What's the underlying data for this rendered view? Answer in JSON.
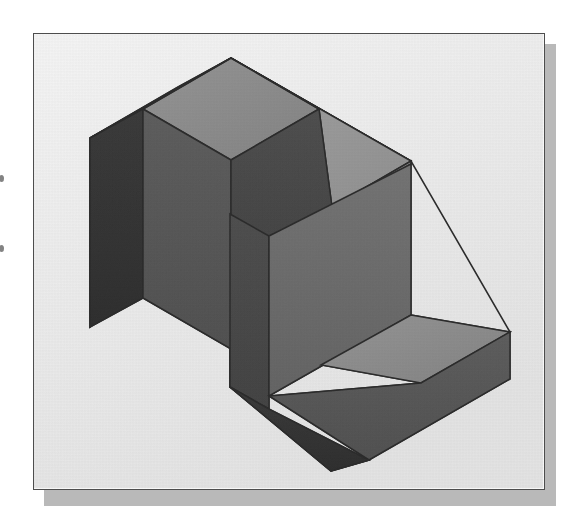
{
  "page": {
    "background_color": "#ffffff",
    "margin_marks": [
      "bullet-mark",
      "bullet-mark"
    ]
  },
  "figure": {
    "frame": {
      "border_color": "#4d4d4d",
      "fill_color": "#fbfbfb",
      "shadow_color": "#b9b9b9",
      "x": 33,
      "y": 33,
      "width": 512,
      "height": 457
    },
    "caption": "",
    "palette": {
      "top_light": "#9a9a9a",
      "top_mid": "#8d8d8d",
      "face_right": "#7e7e7e",
      "face_mid": "#6a6a6a",
      "face_dark": "#575757",
      "face_darker": "#4a4a4a",
      "face_darkest": "#343434",
      "outline": "#2b2b2b",
      "background": "#ededed"
    },
    "object": {
      "name": "stepped-L-block",
      "projection": "isometric",
      "description": "Solid composed of an upright slab on the left, a tall upright block at centre, and a low horizontal slab stepping down to the right.",
      "faces": [
        {
          "id": "left-slab-top",
          "shade": "top_mid",
          "points": "230,57 318,108 230,159 142,108"
        },
        {
          "id": "left-slab-top-rear",
          "shade": "top_light",
          "points": "230,57 142,108 89,137 176,86"
        },
        {
          "id": "left-slab-side",
          "shade": "face_darkest",
          "points": "89,137 142,108 142,297 89,326"
        },
        {
          "id": "left-slab-front",
          "shade": "face_dark",
          "points": "142,108 230,159 230,348 142,297"
        },
        {
          "id": "notch-inner-top",
          "shade": "face_darker",
          "points": "230,159 318,108 396,153 318,198"
        },
        {
          "id": "upper-top-right",
          "shade": "top_light",
          "points": "318,108 230,57 382,144 410,160"
        },
        {
          "id": "step-top-strip",
          "shade": "top_mid",
          "points": "318,198 396,153 410,160 332,206"
        },
        {
          "id": "upper-block-face",
          "shade": "face_mid",
          "points": "228,212 318,160 318,232 228,284"
        },
        {
          "id": "mid-front-left",
          "shade": "face_darker",
          "points": "228,212 228,386 268,409 268,236"
        },
        {
          "id": "mid-front-right",
          "shade": "face_mid",
          "points": "268,236 410,160 410,313 268,395"
        },
        {
          "id": "lower-slab-top",
          "shade": "top_mid",
          "points": "410,313 509,330 420,381 320,363"
        },
        {
          "id": "lower-slab-front",
          "shade": "face_dark",
          "points": "268,395 410,313 509,330 368,458"
        },
        {
          "id": "lower-slab-left",
          "shade": "face_darkest",
          "points": "228,386 268,395 368,458 330,470"
        }
      ]
    }
  }
}
